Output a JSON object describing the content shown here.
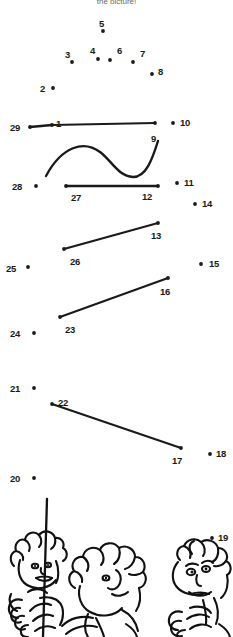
{
  "page": {
    "header_text": "the picture!",
    "width": 233,
    "height": 637,
    "background_color": "#ffffff",
    "ink_color": "#1a1a1a"
  },
  "puzzle": {
    "type": "connect-the-dots",
    "dot_count": 29,
    "dot_radius": 1.9,
    "dots": [
      {
        "n": "1",
        "x": 52,
        "y": 125,
        "label_x": 56,
        "label_y": 119
      },
      {
        "n": "2",
        "x": 53,
        "y": 88,
        "label_x": 40,
        "label_y": 84
      },
      {
        "n": "3",
        "x": 72,
        "y": 62,
        "label_x": 65,
        "label_y": 50
      },
      {
        "n": "4",
        "x": 98,
        "y": 59,
        "label_x": 90,
        "label_y": 46
      },
      {
        "n": "5",
        "x": 103,
        "y": 31,
        "label_x": 99,
        "label_y": 19
      },
      {
        "n": "6",
        "x": 110,
        "y": 60,
        "label_x": 117,
        "label_y": 46
      },
      {
        "n": "7",
        "x": 133,
        "y": 62,
        "label_x": 140,
        "label_y": 49
      },
      {
        "n": "8",
        "x": 152,
        "y": 74,
        "label_x": 158,
        "label_y": 67
      },
      {
        "n": "9",
        "x": 155,
        "y": 123,
        "label_x": 151,
        "label_y": 134
      },
      {
        "n": "10",
        "x": 173,
        "y": 123,
        "label_x": 180,
        "label_y": 118
      },
      {
        "n": "11",
        "x": 177,
        "y": 183,
        "label_x": 184,
        "label_y": 178
      },
      {
        "n": "12",
        "x": 158,
        "y": 186,
        "label_x": 142,
        "label_y": 192
      },
      {
        "n": "13",
        "x": 158,
        "y": 223,
        "label_x": 151,
        "label_y": 231
      },
      {
        "n": "14",
        "x": 195,
        "y": 204,
        "label_x": 202,
        "label_y": 199
      },
      {
        "n": "15",
        "x": 201,
        "y": 264,
        "label_x": 209,
        "label_y": 259
      },
      {
        "n": "16",
        "x": 168,
        "y": 278,
        "label_x": 160,
        "label_y": 287
      },
      {
        "n": "17",
        "x": 181,
        "y": 448,
        "label_x": 172,
        "label_y": 456
      },
      {
        "n": "18",
        "x": 210,
        "y": 454,
        "label_x": 216,
        "label_y": 449
      },
      {
        "n": "19",
        "x": 212,
        "y": 538,
        "label_x": 218,
        "label_y": 533
      },
      {
        "n": "20",
        "x": 34,
        "y": 478,
        "label_x": 10,
        "label_y": 474
      },
      {
        "n": "21",
        "x": 34,
        "y": 388,
        "label_x": 10,
        "label_y": 384
      },
      {
        "n": "22",
        "x": 52,
        "y": 404,
        "label_x": 58,
        "label_y": 398
      },
      {
        "n": "23",
        "x": 60,
        "y": 317,
        "label_x": 65,
        "label_y": 325
      },
      {
        "n": "24",
        "x": 34,
        "y": 333,
        "label_x": 10,
        "label_y": 329
      },
      {
        "n": "25",
        "x": 28,
        "y": 267,
        "label_x": 6,
        "label_y": 264
      },
      {
        "n": "26",
        "x": 64,
        "y": 249,
        "label_x": 70,
        "label_y": 257
      },
      {
        "n": "27",
        "x": 66,
        "y": 186,
        "label_x": 71,
        "label_y": 193
      },
      {
        "n": "28",
        "x": 36,
        "y": 186,
        "label_x": 12,
        "label_y": 182
      },
      {
        "n": "29",
        "x": 30,
        "y": 127,
        "label_x": 10,
        "label_y": 123
      }
    ],
    "segments": [
      {
        "name": "segment-29-1",
        "from": "29",
        "to": "1",
        "kind": "line",
        "width": 2.6
      },
      {
        "name": "segment-1-9",
        "from": "1",
        "to": "9",
        "kind": "line",
        "width": 1.8
      },
      {
        "name": "segment-27-12",
        "from": "27",
        "to": "12",
        "kind": "line",
        "width": 2.4
      },
      {
        "name": "segment-26-13",
        "from": "26",
        "to": "13",
        "kind": "line",
        "width": 2.2
      },
      {
        "name": "segment-23-16",
        "from": "23",
        "to": "16",
        "kind": "line",
        "width": 2.2
      },
      {
        "name": "segment-22-17",
        "from": "22",
        "to": "17",
        "kind": "line",
        "width": 2.2
      }
    ],
    "curves": [
      {
        "name": "wave-curve-to-9",
        "path": "M 46 176 C 62 146, 84 140, 100 152 C 112 161, 118 176, 133 177 C 146 177, 152 160, 158 141",
        "width": 2.4
      }
    ],
    "pole": {
      "name": "flag-pole",
      "path": "M 47 499 L 43 637",
      "width": 2.2
    }
  },
  "characters": [
    {
      "name": "character-left",
      "description": "curly-haired kid peeking, holding pole"
    },
    {
      "name": "character-middle",
      "description": "curly-haired kid with hand near chin"
    },
    {
      "name": "character-right",
      "description": "kid with spiky hair looking up"
    }
  ]
}
